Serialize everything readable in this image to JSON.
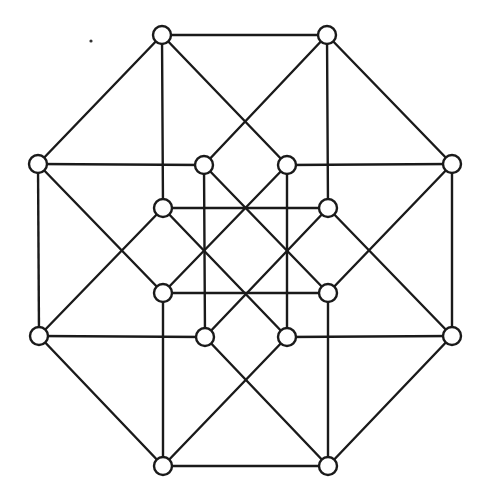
{
  "diagram": {
    "title": "",
    "type": "graph",
    "colors": {
      "stroke": "#1a1a1a",
      "node_fill": "#ffffff",
      "background": "#ffffff"
    },
    "node_radius": 9,
    "nodes": [
      {
        "id": "O1",
        "x": 162,
        "y": 35
      },
      {
        "id": "O2",
        "x": 327,
        "y": 35
      },
      {
        "id": "O3",
        "x": 452,
        "y": 164
      },
      {
        "id": "O4",
        "x": 452,
        "y": 336
      },
      {
        "id": "O5",
        "x": 328,
        "y": 466
      },
      {
        "id": "O6",
        "x": 163,
        "y": 466
      },
      {
        "id": "O7",
        "x": 39,
        "y": 336
      },
      {
        "id": "O8",
        "x": 38,
        "y": 164
      },
      {
        "id": "I1",
        "x": 204,
        "y": 165
      },
      {
        "id": "I2",
        "x": 287,
        "y": 165
      },
      {
        "id": "I3",
        "x": 328,
        "y": 208
      },
      {
        "id": "I4",
        "x": 328,
        "y": 293
      },
      {
        "id": "I5",
        "x": 287,
        "y": 337
      },
      {
        "id": "I6",
        "x": 205,
        "y": 337
      },
      {
        "id": "I7",
        "x": 163,
        "y": 293
      },
      {
        "id": "I8",
        "x": 163,
        "y": 208
      }
    ],
    "edges": [
      [
        "O1",
        "O2"
      ],
      [
        "O2",
        "O3"
      ],
      [
        "O3",
        "O4"
      ],
      [
        "O4",
        "O5"
      ],
      [
        "O5",
        "O6"
      ],
      [
        "O6",
        "O7"
      ],
      [
        "O7",
        "O8"
      ],
      [
        "O8",
        "O1"
      ],
      [
        "O1",
        "I8"
      ],
      [
        "O2",
        "I3"
      ],
      [
        "O6",
        "I7"
      ],
      [
        "O5",
        "I4"
      ],
      [
        "O8",
        "I1"
      ],
      [
        "O3",
        "I2"
      ],
      [
        "O7",
        "I6"
      ],
      [
        "O4",
        "I5"
      ],
      [
        "O1",
        "I2"
      ],
      [
        "O2",
        "I1"
      ],
      [
        "O8",
        "I7"
      ],
      [
        "O7",
        "I8"
      ],
      [
        "O3",
        "I4"
      ],
      [
        "O4",
        "I3"
      ],
      [
        "O6",
        "I5"
      ],
      [
        "O5",
        "I6"
      ],
      [
        "I1",
        "I4"
      ],
      [
        "I2",
        "I7"
      ],
      [
        "I8",
        "I5"
      ],
      [
        "I3",
        "I6"
      ],
      [
        "I8",
        "I3"
      ],
      [
        "I7",
        "I4"
      ],
      [
        "I1",
        "I6"
      ],
      [
        "I2",
        "I5"
      ]
    ],
    "artifacts": [
      {
        "type": "speck",
        "x": 91,
        "y": 41
      }
    ]
  }
}
